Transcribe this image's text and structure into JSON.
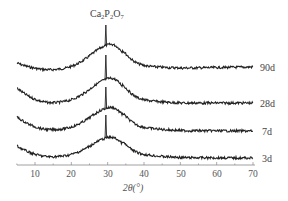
{
  "chart_data": {
    "type": "line",
    "title": "",
    "xlabel": "2θ(°)",
    "ylabel": "",
    "xlim": [
      5,
      70
    ],
    "x_ticks": [
      10,
      20,
      30,
      40,
      50,
      60,
      70
    ],
    "grid": false,
    "legend_position": "inline-right",
    "annotations": [
      {
        "text": "Ca2P2O7",
        "x": 29.5,
        "type": "sharp-peak"
      }
    ],
    "series": [
      {
        "name": "90d",
        "description": "amorphous hump centered ~30°, sharp Ca2P2O7 peak at 29.5°",
        "offset_order": 4
      },
      {
        "name": "28d",
        "description": "amorphous hump centered ~30°, sharp Ca2P2O7 peak at 29.5°",
        "offset_order": 3
      },
      {
        "name": "7d",
        "description": "amorphous hump centered ~30°, sharp Ca2P2O7 peak at 29.5°",
        "offset_order": 2
      },
      {
        "name": "3d",
        "description": "amorphous hump centered ~30°, sharp Ca2P2O7 peak at 29.5°",
        "offset_order": 1
      }
    ]
  },
  "labels": {
    "peak_main": "Ca",
    "peak_sub1": "2",
    "peak_mid": "P",
    "peak_sub2": "2",
    "peak_end": "O",
    "peak_sub3": "7",
    "xlabel": "2θ(°)",
    "ticks": [
      "10",
      "20",
      "30",
      "40",
      "50",
      "60",
      "70"
    ],
    "series": [
      "90d",
      "28d",
      "7d",
      "3d"
    ]
  }
}
